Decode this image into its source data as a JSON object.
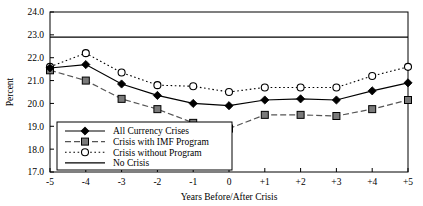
{
  "chart_data": {
    "type": "line",
    "title": "",
    "xlabel": "Years Before/After Crisis",
    "ylabel": "Percent",
    "x": [
      -5,
      -4,
      -3,
      -2,
      -1,
      0,
      1,
      2,
      3,
      4,
      5
    ],
    "xtick_labels": [
      "-5",
      "-4",
      "-3",
      "-2",
      "-1",
      "0",
      "+1",
      "+2",
      "+3",
      "+4",
      "+5"
    ],
    "ytick_labels": [
      "17.0",
      "18.0",
      "19.0",
      "20.0",
      "21.0",
      "22.0",
      "23.0",
      "24.0"
    ],
    "ylim": [
      17.0,
      24.0
    ],
    "xlim": [
      -5,
      5
    ],
    "grid": false,
    "legend_position": "lower-left-inside",
    "series": [
      {
        "name": "All Currency Crises",
        "marker": "filled-diamond",
        "line_style": "solid",
        "color": "#000000",
        "values": [
          21.55,
          21.7,
          20.85,
          20.35,
          20.0,
          19.9,
          20.15,
          20.2,
          20.15,
          20.55,
          20.9
        ]
      },
      {
        "name": "Crisis with IMF Program",
        "marker": "filled-square",
        "line_style": "dashed",
        "color": "#555555",
        "values": [
          21.45,
          21.0,
          20.2,
          19.75,
          19.15,
          18.9,
          19.5,
          19.5,
          19.45,
          19.75,
          20.15
        ]
      },
      {
        "name": "Crisis without Program",
        "marker": "open-circle",
        "line_style": "dotted",
        "color": "#000000",
        "values": [
          21.6,
          22.2,
          21.35,
          20.8,
          20.75,
          20.5,
          20.7,
          20.7,
          20.7,
          21.2,
          21.6
        ]
      },
      {
        "name": "No Crisis",
        "marker": "none",
        "line_style": "solid",
        "color": "#000000",
        "values": [
          22.9,
          22.9,
          22.9,
          22.9,
          22.9,
          22.9,
          22.9,
          22.9,
          22.9,
          22.9,
          22.9
        ]
      }
    ]
  }
}
